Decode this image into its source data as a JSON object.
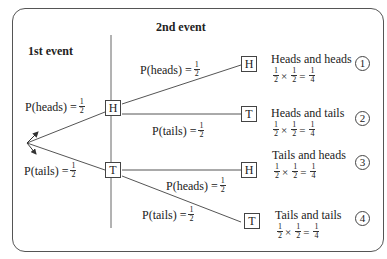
{
  "headings": {
    "first_event": "1st event",
    "second_event": "2nd event"
  },
  "first_level": {
    "heads_prob": {
      "label": "P(heads) =",
      "num": "1",
      "den": "2"
    },
    "tails_prob": {
      "label": "P(tails) =",
      "num": "1",
      "den": "2"
    },
    "nodes": [
      {
        "label": "H"
      },
      {
        "label": "T"
      }
    ]
  },
  "second_level": {
    "probs": [
      {
        "label": "P(heads) =",
        "num": "1",
        "den": "2"
      },
      {
        "label": "P(tails) =",
        "num": "1",
        "den": "2"
      },
      {
        "label": "P(heads) =",
        "num": "1",
        "den": "2"
      },
      {
        "label": "P(tails) =",
        "num": "1",
        "den": "2"
      }
    ],
    "nodes": [
      {
        "label": "H"
      },
      {
        "label": "T"
      },
      {
        "label": "H"
      },
      {
        "label": "T"
      }
    ]
  },
  "outcomes": [
    {
      "title": "Heads and heads",
      "a_num": "1",
      "a_den": "2",
      "times": "×",
      "b_num": "1",
      "b_den": "2",
      "equals": "=",
      "r_num": "1",
      "r_den": "4",
      "index": "1"
    },
    {
      "title": "Heads and tails",
      "a_num": "1",
      "a_den": "2",
      "times": "×",
      "b_num": "1",
      "b_den": "2",
      "equals": "=",
      "r_num": "1",
      "r_den": "4",
      "index": "2"
    },
    {
      "title": "Tails and heads",
      "a_num": "1",
      "a_den": "2",
      "times": "×",
      "b_num": "1",
      "b_den": "2",
      "equals": "=",
      "r_num": "1",
      "r_den": "4",
      "index": "3"
    },
    {
      "title": "Tails and tails",
      "a_num": "1",
      "a_den": "2",
      "times": "×",
      "b_num": "1",
      "b_den": "2",
      "equals": "=",
      "r_num": "1",
      "r_den": "4",
      "index": "4"
    }
  ],
  "colors": {
    "line": "#555555",
    "text": "#222222",
    "background": "#ffffff"
  }
}
